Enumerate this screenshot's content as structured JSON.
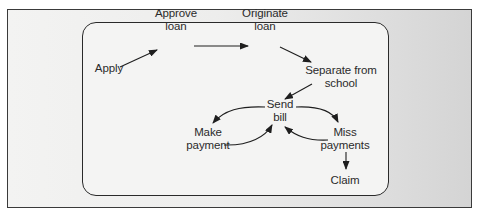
{
  "diagram": {
    "nodes": [
      {
        "id": "apply",
        "lines": [
          "Apply"
        ]
      },
      {
        "id": "approve-loan",
        "lines": [
          "Approve",
          "loan"
        ]
      },
      {
        "id": "originate-loan",
        "lines": [
          "Originate",
          "loan"
        ]
      },
      {
        "id": "separate-from-school",
        "lines": [
          "Separate from",
          "school"
        ]
      },
      {
        "id": "send-bill",
        "lines": [
          "Send",
          "bill"
        ]
      },
      {
        "id": "make-payment",
        "lines": [
          "Make",
          "payment"
        ]
      },
      {
        "id": "miss-payments",
        "lines": [
          "Miss",
          "payments"
        ]
      },
      {
        "id": "claim",
        "lines": [
          "Claim"
        ]
      }
    ],
    "edges": [
      {
        "from": "apply",
        "to": "approve-loan"
      },
      {
        "from": "approve-loan",
        "to": "originate-loan"
      },
      {
        "from": "originate-loan",
        "to": "separate-from-school"
      },
      {
        "from": "separate-from-school",
        "to": "send-bill"
      },
      {
        "from": "send-bill",
        "to": "make-payment"
      },
      {
        "from": "make-payment",
        "to": "send-bill"
      },
      {
        "from": "send-bill",
        "to": "miss-payments"
      },
      {
        "from": "miss-payments",
        "to": "send-bill"
      },
      {
        "from": "miss-payments",
        "to": "claim"
      }
    ],
    "colors": {
      "line": "#1e1e1e",
      "text": "#2b2b2b",
      "frame": "#3a3a3a"
    }
  }
}
